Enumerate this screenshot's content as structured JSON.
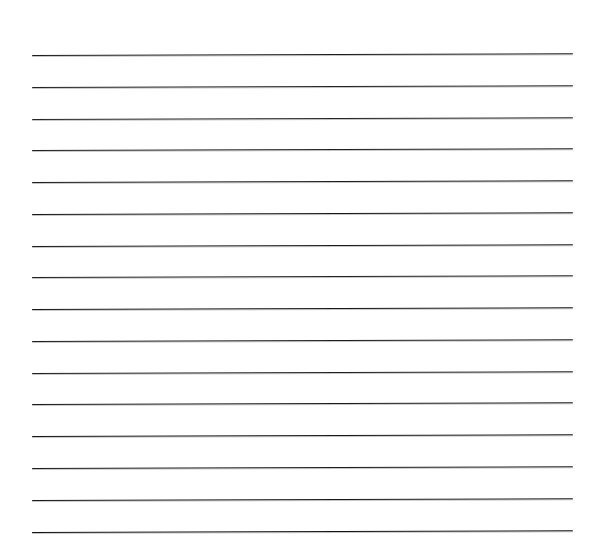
{
  "sheet": {
    "kind": "ruled-paper",
    "label": "Blank ruled paper sheet",
    "width": 593,
    "height": 560,
    "background_color": "#ffffff",
    "ink_color": "#1a1a1a",
    "text_content": "",
    "orientation": "landscape"
  },
  "ruling": {
    "line_count": 16,
    "left_x": 32,
    "right_x": 573,
    "line_length": 541,
    "first_line_y": 55,
    "line_spacing": 31.9,
    "slant_degrees": -0.19,
    "top_margin_height": 55,
    "bottom_margin_height": 27,
    "left_margin_width": 32,
    "right_margin_width": 20
  },
  "lines": [
    {
      "index": 1,
      "y": 55.0,
      "thickness": 1.3,
      "color": "#1d1d1d"
    },
    {
      "index": 2,
      "y": 86.5,
      "thickness": 1.2,
      "color": "#222222"
    },
    {
      "index": 3,
      "y": 118.5,
      "thickness": 1.0,
      "color": "#262626"
    },
    {
      "index": 4,
      "y": 150.0,
      "thickness": 1.1,
      "color": "#202020"
    },
    {
      "index": 5,
      "y": 182.0,
      "thickness": 1.2,
      "color": "#1d1d1d"
    },
    {
      "index": 6,
      "y": 213.5,
      "thickness": 1.3,
      "color": "#191919"
    },
    {
      "index": 7,
      "y": 245.5,
      "thickness": 1.2,
      "color": "#1c1c1c"
    },
    {
      "index": 8,
      "y": 277.0,
      "thickness": 1.1,
      "color": "#232323"
    },
    {
      "index": 9,
      "y": 289.0,
      "thickness": 0.0,
      "color": "#ffffff"
    },
    {
      "index": 10,
      "y": 309.0,
      "thickness": 1.3,
      "color": "#181818"
    },
    {
      "index": 11,
      "y": 340.5,
      "thickness": 1.2,
      "color": "#1e1e1e"
    },
    {
      "index": 12,
      "y": 372.5,
      "thickness": 1.1,
      "color": "#212121"
    },
    {
      "index": 13,
      "y": 404.0,
      "thickness": 1.2,
      "color": "#1b1b1b"
    },
    {
      "index": 14,
      "y": 436.0,
      "thickness": 1.3,
      "color": "#171717"
    },
    {
      "index": 15,
      "y": 467.5,
      "thickness": 1.2,
      "color": "#1d1d1d"
    },
    {
      "index": 16,
      "y": 499.5,
      "thickness": 1.2,
      "color": "#1a1a1a"
    },
    {
      "index": 17,
      "y": 531.5,
      "thickness": 1.4,
      "color": "#141414"
    }
  ]
}
